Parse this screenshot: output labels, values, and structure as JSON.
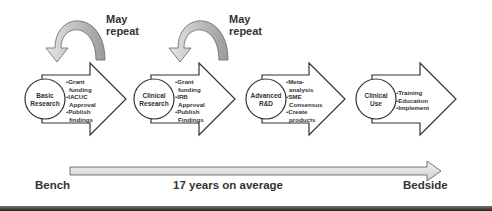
{
  "repeat_labels": [
    {
      "line1": "May",
      "line2": "repeat"
    },
    {
      "line1": "May",
      "line2": "repeat"
    }
  ],
  "stages": [
    {
      "name_line1": "Basic",
      "name_line2": "Research",
      "bullets": [
        "•Grant",
        " funding",
        "•IACUC",
        " Approval",
        "•Publish",
        " findings"
      ]
    },
    {
      "name_line1": "Clinical",
      "name_line2": "Research",
      "bullets": [
        "•Grant",
        " funding",
        "•IRB",
        " Approval",
        "•Publish",
        " Findings"
      ]
    },
    {
      "name_line1": "Advanced",
      "name_line2": "R&D",
      "bullets": [
        "•Meta-",
        " analysis",
        "•SME",
        " Consensus",
        "•Create",
        " products"
      ]
    },
    {
      "name_line1": "Clinical",
      "name_line2": "Use",
      "bullets": [
        "•Training",
        "•Education",
        "•Implement"
      ]
    }
  ],
  "timeline": {
    "start": "Bench",
    "middle": "17 years on average",
    "end": "Bedside"
  },
  "colors": {
    "arrow_stroke": "#333333",
    "curved_arrow_light": "#e0e0e0",
    "curved_arrow_dark": "#a8a8a8",
    "timeline_fill": "#dcdcdc"
  }
}
